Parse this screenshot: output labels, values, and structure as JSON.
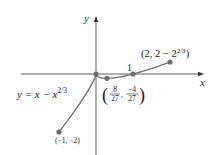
{
  "figure": {
    "type": "function-graph",
    "equation": "y = x − x^{2/3}",
    "equation_parts": {
      "lhs": "y = x − x",
      "exp": "2/3"
    },
    "axes": {
      "x_label": "x",
      "y_label": "y",
      "tick_label_1": "1"
    },
    "points": [
      {
        "name": "left-endpoint",
        "label": "(−1, −2)",
        "x": -1,
        "y": -2
      },
      {
        "name": "origin",
        "label": "",
        "x": 0,
        "y": 0
      },
      {
        "name": "local-min",
        "label_parts": {
          "x_num": "8",
          "x_den": "27",
          "y_num": "−4",
          "y_den": "27"
        },
        "x": 0.2963,
        "y": -0.1481
      },
      {
        "name": "x-intercept",
        "label": "1",
        "x": 1,
        "y": 0
      },
      {
        "name": "right-endpoint",
        "label_parts": {
          "base": "(2, 2 − 2",
          "exp": "2/3",
          "close": ")"
        },
        "x": 2,
        "y": 0.4126
      }
    ],
    "colors": {
      "curve": "#6b6b6b",
      "point": "#6b6b6b",
      "axis": "#333333",
      "text": "#222222"
    }
  }
}
